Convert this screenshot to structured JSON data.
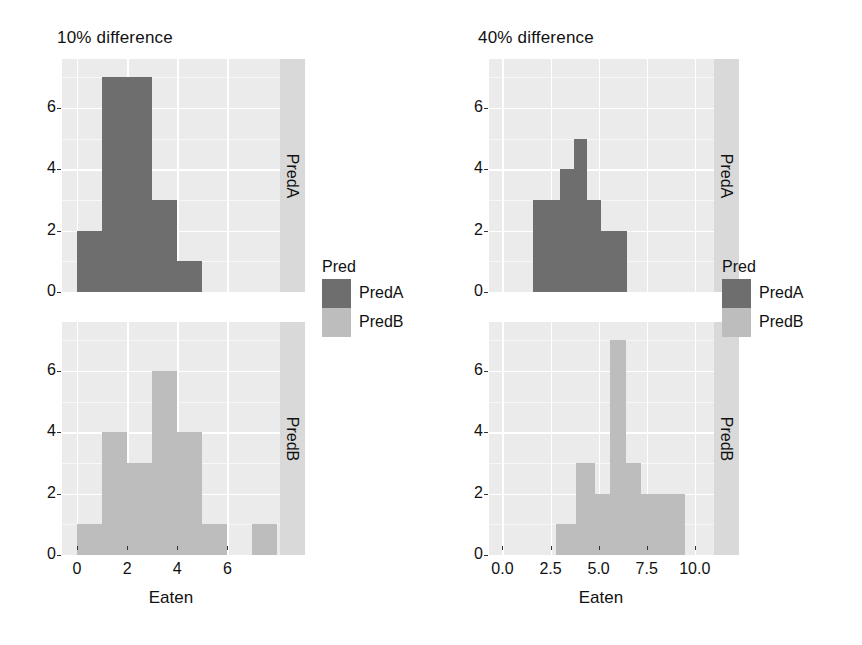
{
  "figures": [
    {
      "id": "left",
      "title": "10% difference",
      "xlabel": "Eaten",
      "xticks": [
        "0",
        "2",
        "4",
        "6"
      ],
      "xtick_values": [
        0,
        2,
        4,
        6
      ],
      "yticks": [
        "0",
        "2",
        "4",
        "6"
      ],
      "ytick_values": [
        0,
        2,
        4,
        6
      ],
      "facets": [
        {
          "label": "PredA",
          "color": "#6e6e6e"
        },
        {
          "label": "PredB",
          "color": "#bdbdbd"
        }
      ],
      "legend": {
        "title": "Pred",
        "items": [
          {
            "label": "PredA",
            "color": "#6e6e6e"
          },
          {
            "label": "PredB",
            "color": "#bdbdbd"
          }
        ]
      }
    },
    {
      "id": "right",
      "title": "40% difference",
      "xlabel": "Eaten",
      "xticks": [
        "0.0",
        "2.5",
        "5.0",
        "7.5",
        "10.0"
      ],
      "xtick_values": [
        0,
        2.5,
        5,
        7.5,
        10
      ],
      "yticks": [
        "0",
        "2",
        "4",
        "6"
      ],
      "ytick_values": [
        0,
        2,
        4,
        6
      ],
      "facets": [
        {
          "label": "PredA",
          "color": "#6e6e6e"
        },
        {
          "label": "PredB",
          "color": "#bdbdbd"
        }
      ],
      "legend": {
        "title": "Pred",
        "items": [
          {
            "label": "PredA",
            "color": "#6e6e6e"
          },
          {
            "label": "PredB",
            "color": "#bdbdbd"
          }
        ]
      }
    }
  ],
  "chart_data": [
    {
      "type": "bar",
      "title": "10% difference",
      "xlabel": "Eaten",
      "ylabel": "",
      "xlim": [
        -0.6,
        8.1
      ],
      "ylim": [
        0,
        7.6
      ],
      "grid": true,
      "legend_position": "right",
      "facet_variable": "Pred",
      "series": [
        {
          "name": "PredA",
          "color": "#6e6e6e",
          "bin_edges": [
            0,
            1,
            2,
            3,
            4,
            5
          ],
          "values": [
            2,
            7,
            7,
            3,
            1
          ]
        },
        {
          "name": "PredB",
          "color": "#bdbdbd",
          "bin_edges": [
            0,
            1,
            2,
            3,
            4,
            5,
            6,
            7,
            8
          ],
          "values": [
            1,
            4,
            3,
            6,
            4,
            1,
            0,
            1
          ]
        }
      ]
    },
    {
      "type": "bar",
      "title": "40% difference",
      "xlabel": "Eaten",
      "ylabel": "",
      "xlim": [
        -0.7,
        11.0
      ],
      "ylim": [
        0,
        7.6
      ],
      "grid": true,
      "legend_position": "right",
      "facet_variable": "Pred",
      "series": [
        {
          "name": "PredA",
          "color": "#6e6e6e",
          "bin_edges": [
            1.6,
            2.3,
            3.0,
            3.7,
            4.4,
            5.1,
            5.8,
            6.5
          ],
          "values": [
            3,
            3,
            4,
            5,
            3,
            2,
            2
          ]
        },
        {
          "name": "PredB",
          "color": "#bdbdbd",
          "bin_edges": [
            2.8,
            3.8,
            4.8,
            5.6,
            6.4,
            7.2,
            8.2,
            9.5
          ],
          "values": [
            1,
            3,
            2,
            7,
            3,
            2,
            2
          ]
        }
      ]
    }
  ]
}
